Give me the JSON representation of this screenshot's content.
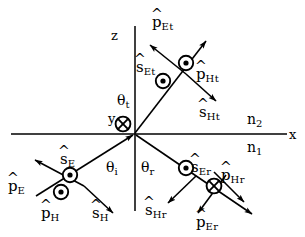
{
  "figure": {
    "background_color": "#ffffff",
    "line_color": "#000000"
  },
  "axes": {
    "x_label": "x",
    "z_label": "z",
    "y_label": "y",
    "y_marker": "circle-cross",
    "y_marker_meaning": "into-page"
  },
  "media": {
    "upper_label": "n",
    "upper_sub": "2",
    "lower_label": "n",
    "lower_sub": "1"
  },
  "angles": [
    {
      "name": "theta-incident",
      "base": "θ",
      "sub": "i"
    },
    {
      "name": "theta-reflected",
      "base": "θ",
      "sub": "r"
    },
    {
      "name": "theta-transmitted",
      "base": "θ",
      "sub": "t"
    }
  ],
  "vectors": {
    "incident": [
      {
        "name": "p-hat-E",
        "base": "p",
        "sub": "E",
        "hat": true
      },
      {
        "name": "s-hat-E",
        "base": "s",
        "sub": "E",
        "hat": true
      },
      {
        "name": "p-hat-H",
        "base": "p",
        "sub": "H",
        "hat": true
      },
      {
        "name": "s-hat-H",
        "base": "s",
        "sub": "H",
        "hat": true
      }
    ],
    "reflected": [
      {
        "name": "s-hat-Er",
        "base": "s",
        "sub": "Er",
        "hat": true
      },
      {
        "name": "p-hat-Hr",
        "base": "p",
        "sub": "Hr",
        "hat": true
      },
      {
        "name": "s-hat-Hr",
        "base": "s",
        "sub": "Hr",
        "hat": true
      },
      {
        "name": "p-hat-Er",
        "base": "p",
        "sub": "Er",
        "hat": true
      }
    ],
    "transmitted": [
      {
        "name": "p-hat-Et",
        "base": "p",
        "sub": "Et",
        "hat": true
      },
      {
        "name": "s-hat-Et",
        "base": "s",
        "sub": "Et",
        "hat": true
      },
      {
        "name": "p-hat-Ht",
        "base": "p",
        "sub": "Ht",
        "hat": true
      },
      {
        "name": "s-hat-Ht",
        "base": "s",
        "sub": "Ht",
        "hat": true
      }
    ]
  },
  "markers": [
    {
      "name": "marker-s-hat-E",
      "type": "circle-dot",
      "meaning": "out-of-page"
    },
    {
      "name": "marker-p-hat-H",
      "type": "circle-dot",
      "meaning": "out-of-page"
    },
    {
      "name": "marker-s-hat-Er",
      "type": "circle-dot",
      "meaning": "out-of-page"
    },
    {
      "name": "marker-p-hat-Hr",
      "type": "circle-cross",
      "meaning": "into-page"
    },
    {
      "name": "marker-s-hat-Et",
      "type": "circle-dot",
      "meaning": "out-of-page"
    },
    {
      "name": "marker-p-hat-Ht",
      "type": "circle-dot",
      "meaning": "out-of-page"
    },
    {
      "name": "marker-y-axis",
      "type": "circle-cross",
      "meaning": "into-page"
    }
  ],
  "hat_glyph": "^"
}
